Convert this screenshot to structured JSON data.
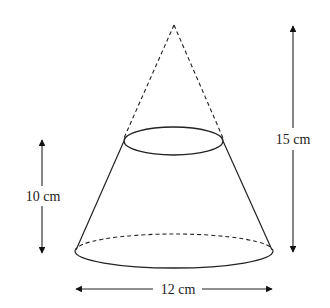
{
  "diagram": {
    "type": "frustum-of-cone",
    "labels": {
      "frustum_height": "10 cm",
      "cone_height": "15 cm",
      "base_diameter": "12 cm"
    },
    "colors": {
      "stroke": "#222222",
      "background": "#ffffff"
    }
  }
}
